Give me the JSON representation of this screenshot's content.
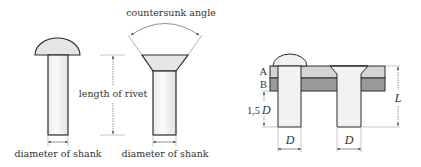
{
  "diagram": {
    "colors": {
      "outline": "#2a2a2a",
      "rivet_fill": "#f2f2f2",
      "rivet_head_fill": "#e6e6e6",
      "plate_a": "#d4d4d4",
      "plate_b": "#9a9a9a",
      "dim_line": "#444444"
    },
    "left_panel": {
      "snap_head_rivet": {
        "shank_label": "diameter of shank"
      },
      "length_label": "length of rivet",
      "countersunk_rivet": {
        "angle_label": "countersunk angle",
        "shank_label": "diameter of shank"
      }
    },
    "right_panel": {
      "plate_labels": [
        "A",
        "B"
      ],
      "protrusion_label_num": "1,5",
      "protrusion_label_var": "D",
      "length_label": "L",
      "diameter_label_left": "D",
      "diameter_label_right": "D"
    }
  }
}
